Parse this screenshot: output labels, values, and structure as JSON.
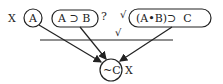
{
  "diagram": {
    "premises": [
      {
        "id": "p1",
        "label": "A",
        "shape": "circle",
        "mark": "X"
      },
      {
        "id": "p2",
        "label": "A ⊃ B",
        "shape": "rounded-rect",
        "mark": "?"
      },
      {
        "id": "p3",
        "label": "(A•B)⊃  C",
        "shape": "rounded-rect",
        "mark": "√"
      }
    ],
    "inference_mark": "√",
    "conclusion": {
      "label": "~C",
      "shape": "circle",
      "mark": "X"
    },
    "marks": {
      "x_left": "X",
      "question": "?",
      "check_top": "√",
      "check_line": "√",
      "x_right": "X"
    },
    "colors": {
      "ink": "#222222",
      "background": "#ffffff"
    }
  }
}
